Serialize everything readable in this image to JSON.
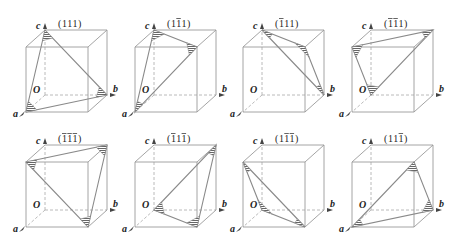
{
  "figure": {
    "cut_caption": "",
    "colors": {
      "edge": "#9a9a9a",
      "hidden_edge": "#a8a8a8",
      "plane_edge": "#8a8a8a",
      "hatch": "#555555",
      "label": "#222222"
    },
    "axis_labels": {
      "a": "a",
      "b": "b",
      "c": "c",
      "origin": "O"
    },
    "layout": {
      "column_offsets": [
        0,
        109,
        217,
        326
      ],
      "row_offsets": [
        0,
        115
      ]
    },
    "cube_geometry": {
      "corners": {
        "O": [
          45,
          95
        ],
        "b": [
          107,
          95
        ],
        "c": [
          45,
          30
        ],
        "bc": [
          107,
          30
        ],
        "a": [
          26,
          112
        ],
        "ab": [
          88,
          112
        ],
        "ac": [
          26,
          47
        ],
        "abc": [
          88,
          47
        ]
      }
    },
    "cubes": [
      {
        "row": 0,
        "col": 0,
        "label": "(111)",
        "label_parts": [
          [
            "1",
            false
          ],
          [
            "1",
            false
          ],
          [
            "1",
            false
          ]
        ],
        "triangle": [
          "c",
          "a",
          "b"
        ]
      },
      {
        "row": 0,
        "col": 1,
        "label": "(1̅1̅... )",
        "label_parts": [
          [
            "1",
            false
          ],
          [
            "1",
            true
          ],
          [
            "1",
            false
          ]
        ],
        "triangle": [
          "c",
          "abc",
          "a"
        ]
      },
      {
        "row": 0,
        "col": 2,
        "label": "(̅1 1 1)",
        "label_parts": [
          [
            "1",
            true
          ],
          [
            "1",
            false
          ],
          [
            "1",
            false
          ]
        ],
        "triangle": [
          "c",
          "abc",
          "b"
        ]
      },
      {
        "row": 0,
        "col": 3,
        "label": "(̅1̅1 1)",
        "label_parts": [
          [
            "1",
            true
          ],
          [
            "1",
            true
          ],
          [
            "1",
            false
          ]
        ],
        "triangle": [
          "ac",
          "bc",
          "O"
        ]
      },
      {
        "row": 1,
        "col": 0,
        "label": "(̅1̅1̅1)",
        "label_parts": [
          [
            "1",
            true
          ],
          [
            "1",
            true
          ],
          [
            "1",
            true
          ]
        ],
        "triangle": [
          "ac",
          "bc",
          "ab"
        ]
      },
      {
        "row": 1,
        "col": 1,
        "label": "(̅1 1 ̅1)",
        "label_parts": [
          [
            "1",
            true
          ],
          [
            "1",
            false
          ],
          [
            "1",
            true
          ]
        ],
        "triangle": [
          "O",
          "bc",
          "ab"
        ]
      },
      {
        "row": 1,
        "col": 2,
        "label": "(1 ̅1̅1)",
        "label_parts": [
          [
            "1",
            false
          ],
          [
            "1",
            true
          ],
          [
            "1",
            true
          ]
        ],
        "triangle": [
          "ac",
          "O",
          "ab"
        ]
      },
      {
        "row": 1,
        "col": 3,
        "label": "(1 1 ̅1)",
        "label_parts": [
          [
            "1",
            false
          ],
          [
            "1",
            false
          ],
          [
            "1",
            true
          ]
        ],
        "triangle": [
          "a",
          "abc",
          "b"
        ]
      }
    ]
  }
}
